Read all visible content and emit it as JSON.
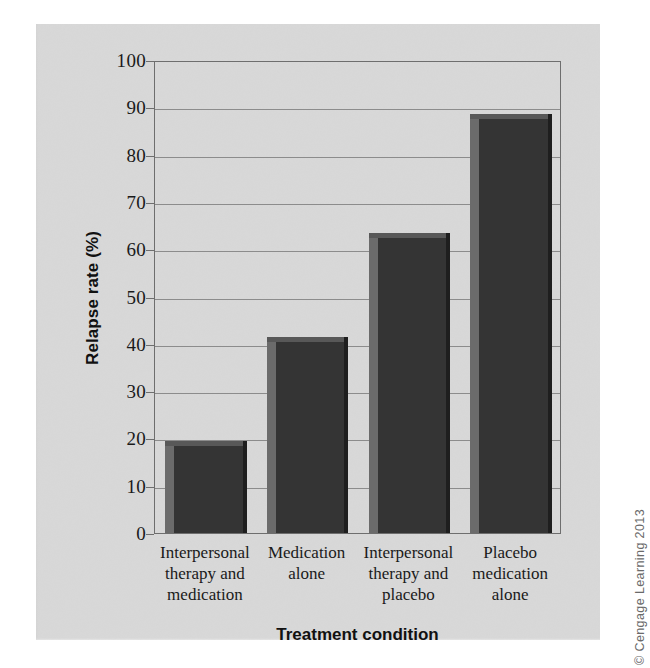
{
  "chart_data": {
    "type": "bar",
    "title": "",
    "categories": [
      "Interpersonal therapy and medication",
      "Medication alone",
      "Interpersonal therapy and placebo",
      "Placebo medication alone"
    ],
    "category_lines": [
      [
        "Interpersonal",
        "therapy and",
        "medication"
      ],
      [
        "Medication",
        "alone"
      ],
      [
        "Interpersonal",
        "therapy and",
        "placebo"
      ],
      [
        "Placebo",
        "medication",
        "alone"
      ]
    ],
    "values": [
      19.5,
      41.5,
      63.5,
      88.5
    ],
    "xlabel": "Treatment condition",
    "ylabel": "Relapse rate (%)",
    "ylim": [
      0,
      100
    ],
    "ytick_values": [
      0,
      10,
      20,
      30,
      40,
      50,
      60,
      70,
      80,
      90,
      100
    ],
    "ytick_labels": [
      "0",
      "10",
      "20",
      "30",
      "40",
      "50",
      "60",
      "70",
      "80",
      "90",
      "100"
    ],
    "grid": true,
    "grid_axis": "y",
    "legend": false,
    "bar_color": "#343434",
    "bar_highlight_color": "#6b6b6b",
    "bar_shadow_color": "#1e1e1e",
    "grid_color": "#8c8c8c",
    "axis_color": "#6e6e6e",
    "background_color": "#d8d8d8"
  },
  "credit": {
    "text": "© Cengage Learning 2013"
  }
}
